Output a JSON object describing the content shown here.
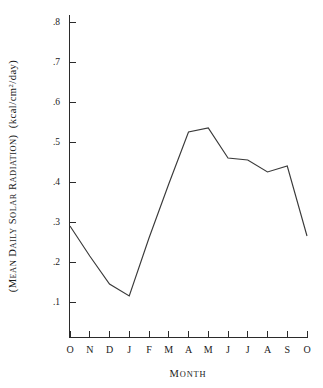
{
  "chart_data": {
    "type": "line",
    "title": "",
    "xlabel": "Month",
    "ylabel": "(Mean Daily Solar Radiation)  (kcal/cm2/day)",
    "ylabel_parts": {
      "open_paren": "(",
      "caps1": "M",
      "small1": "EAN",
      "caps2": "D",
      "small2": "AILY",
      "caps3": "S",
      "small3": "OLAR",
      "caps4": "R",
      "small4": "ADIATION",
      "close_paren": ")",
      "units": "(kcal/cm",
      "units_sup": "2",
      "units_tail": "/day)"
    },
    "xlabel_parts": {
      "caps": "M",
      "small": "ONTH"
    },
    "categories": [
      "O",
      "N",
      "D",
      "J",
      "F",
      "M",
      "A",
      "M",
      "J",
      "J",
      "A",
      "S",
      "O"
    ],
    "x_tick_labels": [
      "O",
      "N",
      "D",
      "J",
      "F",
      "M",
      "A",
      "M",
      "J",
      "J",
      "A",
      "S",
      "O"
    ],
    "values": [
      0.29,
      0.215,
      0.145,
      0.115,
      0.26,
      0.395,
      0.525,
      0.535,
      0.46,
      0.455,
      0.425,
      0.44,
      0.265
    ],
    "y_tick_labels": [
      ".8",
      ".7",
      ".6",
      ".5",
      ".4",
      ".3",
      ".2",
      ".1"
    ],
    "y_tick_values": [
      0.8,
      0.7,
      0.6,
      0.5,
      0.4,
      0.3,
      0.2,
      0.1
    ],
    "ylim": [
      0.0,
      0.8
    ],
    "xlim_indices": [
      0,
      12
    ],
    "grid": false,
    "legend": null,
    "legend_position": "none",
    "line_color": "#3a3a3a",
    "axis_color": "#2b2b2b",
    "background_color": "#ffffff"
  }
}
